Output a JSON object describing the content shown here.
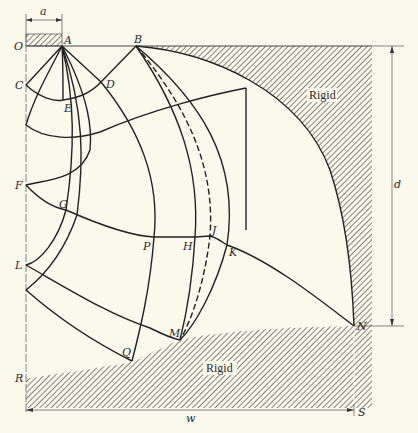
{
  "figure": {
    "type": "slip-line field diagram",
    "points": {
      "O": "O",
      "A": "A",
      "B": "B",
      "C": "C",
      "D": "D",
      "E": "E",
      "F": "F",
      "G": "G",
      "L": "L",
      "P": "P",
      "H": "H",
      "J": "J",
      "K": "K",
      "M": "M",
      "N": "N",
      "Q": "Q",
      "R": "R",
      "S": "S"
    },
    "regions": {
      "rigid_top": "Rigid",
      "rigid_bottom": "Rigid"
    },
    "dimensions": {
      "a": "a",
      "d": "d",
      "w": "w"
    },
    "colors": {
      "background": "#fbf8ec",
      "line": "#222222",
      "hatch": "#444444"
    }
  }
}
